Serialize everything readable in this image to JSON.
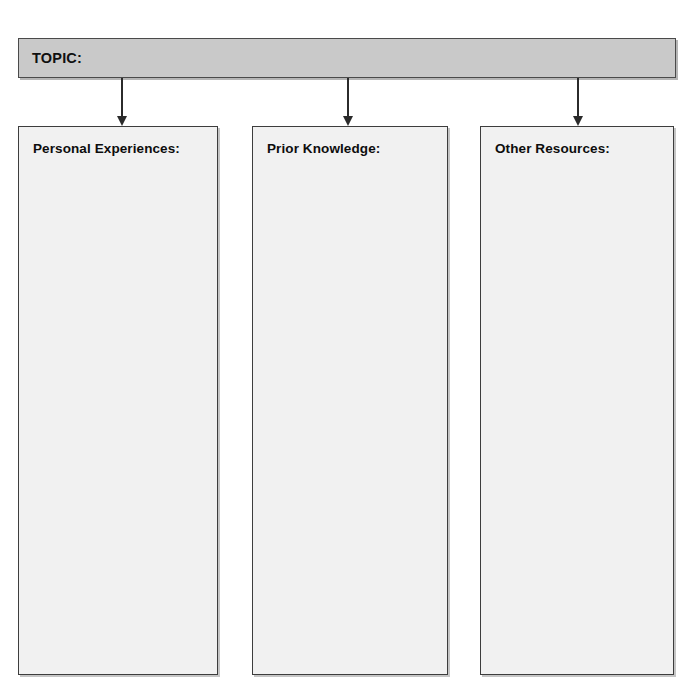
{
  "page": {
    "title": "TOPIC:",
    "kind": "graphic-organizer",
    "background_color": "#ffffff"
  },
  "topic_bar": {
    "label": "TOPIC:",
    "fill_color": "#c9c9c9",
    "border_color": "#4a4a4a"
  },
  "connectors": [
    {
      "name": "arrow-to-personal-experiences",
      "glyph": "down-arrow"
    },
    {
      "name": "arrow-to-prior-knowledge",
      "glyph": "down-arrow"
    },
    {
      "name": "arrow-to-other-resources",
      "glyph": "down-arrow"
    }
  ],
  "columns": [
    {
      "label": "Personal Experiences:",
      "content": ""
    },
    {
      "label": "Prior Knowledge:",
      "content": ""
    },
    {
      "label": "Other Resources:",
      "content": ""
    }
  ],
  "style": {
    "column_fill_color": "#f1f1f1",
    "column_border_color": "#3d3d3d",
    "arrow_color": "#2b2b2b",
    "text_color": "#0d0d0d"
  }
}
